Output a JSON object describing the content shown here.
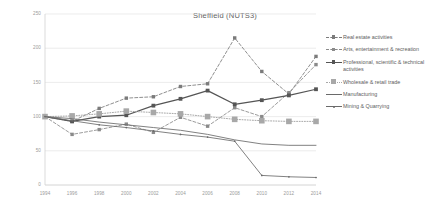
{
  "chart_data": {
    "type": "line",
    "title": "Sheffield (NUTS3)",
    "xlabel": "",
    "ylabel": "",
    "grid": true,
    "legend_position": "right",
    "ylim": [
      0,
      250
    ],
    "yticks": [
      0,
      50,
      100,
      150,
      200,
      250
    ],
    "categories": [
      "1994",
      "1996",
      "1998",
      "2000",
      "2002",
      "2004",
      "2006",
      "2008",
      "2010",
      "2012",
      "2014"
    ],
    "x": [
      1994,
      1996,
      1998,
      2000,
      2002,
      2004,
      2006,
      2008,
      2010,
      2012,
      2014
    ],
    "series": [
      {
        "name": "Real estate activities",
        "style": "dashed",
        "marker": "square",
        "color": "#7b7b7b",
        "values": [
          100,
          93,
          112,
          127,
          129,
          144,
          148,
          215,
          166,
          133,
          188
        ]
      },
      {
        "name": "Arts, entertainment & recreation",
        "style": "dashed",
        "marker": "square",
        "color": "#8a8a8a",
        "values": [
          100,
          74,
          81,
          89,
          77,
          99,
          86,
          113,
          100,
          135,
          176
        ]
      },
      {
        "name": "Professional, scientific & technical activities",
        "style": "solid",
        "marker": "square",
        "color": "#555555",
        "values": [
          100,
          93,
          100,
          102,
          116,
          126,
          138,
          118,
          124,
          131,
          140
        ]
      },
      {
        "name": "Wholesale & retail trade",
        "style": "dotted",
        "marker": "square-large",
        "color": "#a8a8a8",
        "values": [
          100,
          101,
          104,
          108,
          106,
          104,
          100,
          96,
          94,
          93,
          93
        ]
      },
      {
        "name": "Manufacturing",
        "style": "solid",
        "marker": "none",
        "color": "#6a6a6a",
        "values": [
          100,
          97,
          92,
          88,
          84,
          80,
          74,
          66,
          60,
          58,
          58
        ]
      },
      {
        "name": "Mining & Quarrying",
        "style": "solid",
        "marker": "dot",
        "color": "#6a6a6a",
        "values": [
          100,
          94,
          88,
          84,
          79,
          74,
          70,
          64,
          14,
          12,
          11
        ]
      }
    ]
  },
  "legend": {
    "items": [
      {
        "label": "Real estate activities"
      },
      {
        "label": "Arts, entertainment & recreation"
      },
      {
        "label": "Professional, scientific & technical activities"
      },
      {
        "label": "Wholesale & retail trade"
      },
      {
        "label": "Manufacturing"
      },
      {
        "label": "Mining & Quarrying"
      }
    ]
  }
}
